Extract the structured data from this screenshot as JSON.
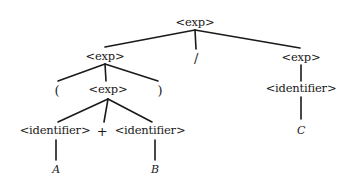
{
  "diagram": {
    "type": "parse-tree",
    "background_color": "#ffffff",
    "ink_color": "#1a1a1a",
    "width": 356,
    "height": 191,
    "expression": "( A + B ) / C",
    "nodes": [
      {
        "id": "root",
        "label": "<exp>",
        "kind": "nonterminal",
        "x": 195,
        "y": 23
      },
      {
        "id": "left-exp",
        "label": "<exp>",
        "kind": "nonterminal",
        "x": 105,
        "y": 57
      },
      {
        "id": "slash",
        "label": "/",
        "kind": "operator",
        "x": 196,
        "y": 58
      },
      {
        "id": "right-exp",
        "label": "<exp>",
        "kind": "nonterminal",
        "x": 301,
        "y": 58
      },
      {
        "id": "lparen",
        "label": "(",
        "kind": "paren",
        "x": 57,
        "y": 90
      },
      {
        "id": "inner-exp",
        "label": "<exp>",
        "kind": "nonterminal",
        "x": 108,
        "y": 90
      },
      {
        "id": "rparen",
        "label": ")",
        "kind": "paren",
        "x": 160,
        "y": 90
      },
      {
        "id": "right-ident",
        "label": "<identifier>",
        "kind": "nonterminal",
        "x": 301,
        "y": 89
      },
      {
        "id": "ident-a",
        "label": "<identifier>",
        "kind": "nonterminal",
        "x": 55,
        "y": 131
      },
      {
        "id": "plus",
        "label": "+",
        "kind": "operator",
        "x": 102,
        "y": 131
      },
      {
        "id": "ident-b",
        "label": "<identifier>",
        "kind": "nonterminal",
        "x": 150,
        "y": 131
      },
      {
        "id": "term-c",
        "label": "C",
        "kind": "terminal",
        "x": 301,
        "y": 130
      },
      {
        "id": "term-a",
        "label": "A",
        "kind": "terminal",
        "x": 56,
        "y": 169
      },
      {
        "id": "term-b",
        "label": "B",
        "kind": "terminal",
        "x": 155,
        "y": 169
      }
    ],
    "edges": [
      {
        "from": "root",
        "to": "left-exp",
        "x1": 195,
        "y1": 30,
        "x2": 105,
        "y2": 47
      },
      {
        "from": "root",
        "to": "slash",
        "x1": 195,
        "y1": 30,
        "x2": 196,
        "y2": 49
      },
      {
        "from": "root",
        "to": "right-exp",
        "x1": 195,
        "y1": 30,
        "x2": 300,
        "y2": 48
      },
      {
        "from": "left-exp",
        "to": "lparen",
        "x1": 105,
        "y1": 64,
        "x2": 58,
        "y2": 81
      },
      {
        "from": "left-exp",
        "to": "inner-exp",
        "x1": 105,
        "y1": 64,
        "x2": 106,
        "y2": 81
      },
      {
        "from": "left-exp",
        "to": "rparen",
        "x1": 105,
        "y1": 64,
        "x2": 158,
        "y2": 81
      },
      {
        "from": "right-exp",
        "to": "right-ident",
        "x1": 301,
        "y1": 65,
        "x2": 301,
        "y2": 81
      },
      {
        "from": "inner-exp",
        "to": "ident-a",
        "x1": 108,
        "y1": 99,
        "x2": 58,
        "y2": 122
      },
      {
        "from": "inner-exp",
        "to": "plus",
        "x1": 108,
        "y1": 99,
        "x2": 104,
        "y2": 122
      },
      {
        "from": "inner-exp",
        "to": "ident-b",
        "x1": 108,
        "y1": 99,
        "x2": 152,
        "y2": 122
      },
      {
        "from": "right-ident",
        "to": "term-c",
        "x1": 301,
        "y1": 97,
        "x2": 301,
        "y2": 119
      },
      {
        "from": "ident-a",
        "to": "term-a",
        "x1": 56,
        "y1": 140,
        "x2": 56,
        "y2": 160
      },
      {
        "from": "ident-b",
        "to": "term-b",
        "x1": 155,
        "y1": 140,
        "x2": 155,
        "y2": 160
      }
    ]
  }
}
